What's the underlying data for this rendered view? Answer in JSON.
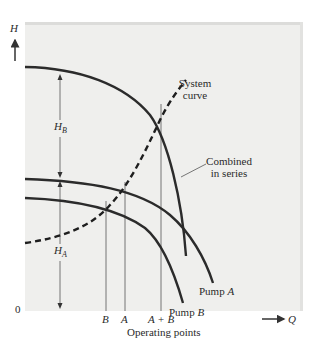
{
  "diagram": {
    "axes": {
      "y_label": "H",
      "x_label": "Q",
      "origin_label": "0",
      "x_axis_caption": "Operating points"
    },
    "head_labels": {
      "hb": {
        "main": "H",
        "sub": "B"
      },
      "ha": {
        "main": "H",
        "sub": "A"
      }
    },
    "curves": {
      "system": {
        "label_line1": "System",
        "label_line2": "curve",
        "style": "dashed"
      },
      "combined": {
        "label_line1": "Combined",
        "label_line2": "in series",
        "style": "solid"
      },
      "pump_a": {
        "label": "Pump",
        "suffix": "A"
      },
      "pump_b": {
        "label": "Pump",
        "suffix": "B"
      }
    },
    "operating_points": [
      {
        "id": "B",
        "label": "B"
      },
      {
        "id": "A",
        "label": "A"
      },
      {
        "id": "AB",
        "label": "A + B"
      }
    ],
    "colors": {
      "panel": "#efefed",
      "curve": "#2b2b2b",
      "thin_line": "#555555"
    }
  }
}
